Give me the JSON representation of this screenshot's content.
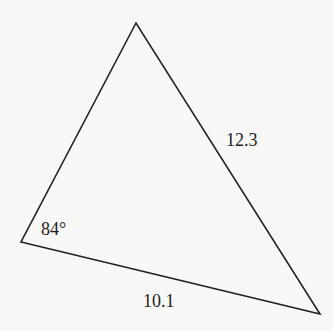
{
  "diagram": {
    "type": "triangle",
    "vertices": {
      "top": [
        136,
        23
      ],
      "left": [
        21,
        242
      ],
      "bottom_right": [
        320,
        314
      ]
    },
    "stroke_color": "#222222",
    "background_color": "#f7f7f5",
    "labels": {
      "angle_left": "84°",
      "side_right": "12.3",
      "side_bottom": "10.1"
    }
  }
}
